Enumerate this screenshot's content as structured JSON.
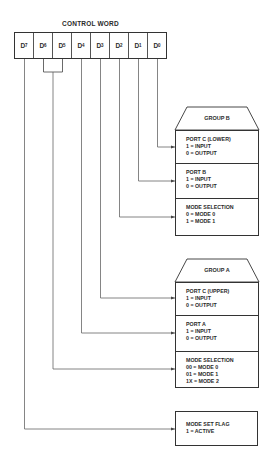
{
  "diagram": {
    "title": "CONTROL WORD",
    "bits": [
      {
        "name": "D",
        "sub": "7"
      },
      {
        "name": "D",
        "sub": "6"
      },
      {
        "name": "D",
        "sub": "5"
      },
      {
        "name": "D",
        "sub": "4"
      },
      {
        "name": "D",
        "sub": "3"
      },
      {
        "name": "D",
        "sub": "2"
      },
      {
        "name": "D",
        "sub": "1"
      },
      {
        "name": "D",
        "sub": "0"
      }
    ],
    "group_b": {
      "title": "GROUP B",
      "sections": [
        {
          "label": "PORT C (LOWER)",
          "lines": [
            "1 = INPUT",
            "0 = OUTPUT"
          ]
        },
        {
          "label": "PORT B",
          "lines": [
            "1 = INPUT",
            "0 = OUTPUT"
          ]
        },
        {
          "label": "MODE SELECTION",
          "lines": [
            "0 = MODE 0",
            "1 = MODE 1"
          ]
        }
      ]
    },
    "group_a": {
      "title": "GROUP A",
      "sections": [
        {
          "label": "PORT C (UPPER)",
          "lines": [
            "1 = INPUT",
            "0 = OUTPUT"
          ]
        },
        {
          "label": "PORT A",
          "lines": [
            "1 = INPUT",
            "0 = OUTPUT"
          ]
        },
        {
          "label": "MODE SELECTION",
          "lines": [
            "00 = MODE 0",
            "01 = MODE 1",
            "1X = MODE 2"
          ]
        }
      ]
    },
    "mode_set_flag": {
      "label": "MODE SET FLAG",
      "lines": [
        "1 = ACTIVE"
      ]
    },
    "connections": [
      {
        "bit": "D0",
        "target": "GROUP B / PORT C (LOWER)"
      },
      {
        "bit": "D1",
        "target": "GROUP B / PORT B"
      },
      {
        "bit": "D2",
        "target": "GROUP B / MODE SELECTION"
      },
      {
        "bit": "D3",
        "target": "GROUP A / PORT C (UPPER)"
      },
      {
        "bit": "D4",
        "target": "GROUP A / PORT A"
      },
      {
        "bit": "D6-D5",
        "target": "GROUP A / MODE SELECTION"
      },
      {
        "bit": "D7",
        "target": "MODE SET FLAG"
      }
    ],
    "colors": {
      "line": "#555555",
      "text": "#2a2a2a",
      "background": "#ffffff"
    }
  }
}
